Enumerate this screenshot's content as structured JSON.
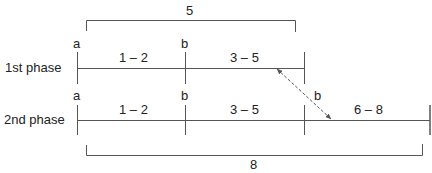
{
  "diagram": {
    "type": "phase-timeline",
    "top_bracket": {
      "label": "5"
    },
    "bottom_bracket": {
      "label": "8"
    },
    "phases": [
      {
        "label": "1st phase",
        "markers": [
          "a",
          "b"
        ],
        "segments": [
          "1 – 2",
          "3 – 5"
        ]
      },
      {
        "label": "2nd phase",
        "markers": [
          "a",
          "b",
          "b"
        ],
        "segments": [
          "1 – 2",
          "3 – 5",
          "6 – 8"
        ]
      }
    ],
    "shift_arrow": {
      "style": "dashed",
      "heads": "both",
      "label": "b"
    },
    "colors": {
      "line": "#555555",
      "text": "#222222",
      "background": "#ffffff"
    }
  }
}
